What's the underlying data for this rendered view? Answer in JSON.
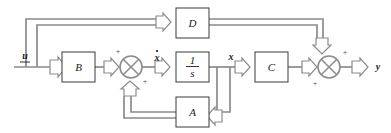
{
  "diagram": {
    "type": "control-block-diagram",
    "colors": {
      "background": "#ffffff",
      "wire": "#8b8b8b",
      "block_border": "#3a3a3a",
      "text": "#1a1a1a"
    },
    "blocks": [
      {
        "id": "B",
        "label": "B",
        "x": 62,
        "y": 52,
        "w": 33,
        "h": 30
      },
      {
        "id": "integrator",
        "label": "1/s",
        "numerator": "1",
        "denominator": "s",
        "x": 176,
        "y": 52,
        "w": 33,
        "h": 30
      },
      {
        "id": "C",
        "label": "C",
        "x": 255,
        "y": 52,
        "w": 33,
        "h": 30
      },
      {
        "id": "D",
        "label": "D",
        "x": 176,
        "y": 8,
        "w": 33,
        "h": 30
      },
      {
        "id": "A",
        "label": "A",
        "x": 176,
        "y": 97,
        "w": 33,
        "h": 30
      }
    ],
    "summing_junctions": [
      {
        "id": "state-sum",
        "cx": 131,
        "cy": 67,
        "r": 11,
        "signs": [
          {
            "text": "+",
            "position": "top-left"
          },
          {
            "text": "+",
            "position": "bottom-right"
          }
        ]
      },
      {
        "id": "output-sum",
        "cx": 329,
        "cy": 67,
        "r": 11,
        "signs": [
          {
            "text": "+",
            "position": "top-right"
          },
          {
            "text": "+",
            "position": "bottom-left"
          }
        ]
      }
    ],
    "signals": [
      {
        "id": "input",
        "label": "u",
        "underlined": true,
        "dotted": false,
        "x": 25,
        "y": 57
      },
      {
        "id": "xdot",
        "label": "x",
        "underlined": false,
        "dotted": true,
        "x": 157,
        "y": 58
      },
      {
        "id": "state",
        "label": "x",
        "underlined": false,
        "dotted": false,
        "x": 231,
        "y": 58
      },
      {
        "id": "output",
        "label": "y",
        "underlined": false,
        "dotted": false,
        "x": 378,
        "y": 68
      }
    ],
    "equations": {
      "state_equation": "xdot = A x + B u",
      "output_equation": "y = C x + D u"
    }
  }
}
